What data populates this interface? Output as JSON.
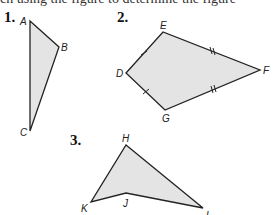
{
  "header_text": "ch using the figure to determine the figure",
  "problems": [
    {
      "number": "1.",
      "shape": "triangle",
      "vertices": [
        "A",
        "B",
        "C"
      ]
    },
    {
      "number": "2.",
      "shape": "kite",
      "vertices": [
        "D",
        "E",
        "F",
        "G"
      ],
      "tick_marks": {
        "single": [
          "DE",
          "DG"
        ],
        "double": [
          "EF",
          "GF"
        ]
      }
    },
    {
      "number": "3.",
      "shape": "concave quadrilateral",
      "vertices": [
        "H",
        "J",
        "K",
        "L"
      ]
    }
  ],
  "labels": {
    "A": "A",
    "B": "B",
    "C": "C",
    "D": "D",
    "E": "E",
    "F": "F",
    "G": "G",
    "H": "H",
    "J": "J",
    "K": "K",
    "L": "L"
  },
  "colors": {
    "fill": "#e4e4e4",
    "stroke": "#222222"
  }
}
